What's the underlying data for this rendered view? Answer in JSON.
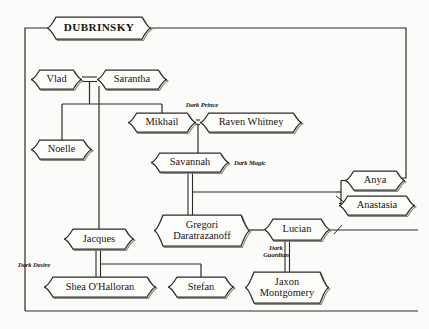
{
  "diagram": {
    "kind": "family-tree",
    "title": "DUBRINSKY",
    "frame_color": "#2c2a26",
    "background_color": "#fbfbfa",
    "line_color": "#2c2a26"
  },
  "nodes": [
    {
      "id": "dubrinsky",
      "label": "DUBRINSKY",
      "x": 47,
      "y": 17,
      "w": 104,
      "h": 22,
      "font": 11.2,
      "bold": true,
      "lines": 1
    },
    {
      "id": "vlad",
      "label": "Vlad",
      "x": 31,
      "y": 70,
      "w": 51,
      "h": 19,
      "font": 10.4,
      "bold": false,
      "lines": 1
    },
    {
      "id": "sarantha",
      "label": "Sarantha",
      "x": 97,
      "y": 70,
      "w": 70,
      "h": 19,
      "font": 10.4,
      "bold": false,
      "lines": 1
    },
    {
      "id": "noelle",
      "label": "Noelle",
      "x": 31,
      "y": 140,
      "w": 61,
      "h": 19,
      "font": 10.4,
      "bold": false,
      "lines": 1
    },
    {
      "id": "mikhail",
      "label": "Mikhail",
      "x": 128,
      "y": 113,
      "w": 68,
      "h": 19,
      "font": 10.4,
      "bold": false,
      "lines": 1
    },
    {
      "id": "raven",
      "label": "Raven Whitney",
      "x": 200,
      "y": 113,
      "w": 102,
      "h": 19,
      "font": 10.4,
      "bold": false,
      "lines": 1
    },
    {
      "id": "savannah",
      "label": "Savannah",
      "x": 151,
      "y": 153,
      "w": 78,
      "h": 19,
      "font": 10.4,
      "bold": false,
      "lines": 1
    },
    {
      "id": "anya",
      "label": "Anya",
      "x": 345,
      "y": 171,
      "w": 60,
      "h": 19,
      "font": 10.4,
      "bold": false,
      "lines": 1
    },
    {
      "id": "anastasia",
      "label": "Anastasia",
      "x": 339,
      "y": 196,
      "w": 76,
      "h": 19,
      "font": 10.4,
      "bold": false,
      "lines": 1
    },
    {
      "id": "gregori",
      "label": "Gregori\nDaratrazanoff",
      "x": 154,
      "y": 215,
      "w": 96,
      "h": 31,
      "font": 10.4,
      "bold": false,
      "lines": 2
    },
    {
      "id": "lucian",
      "label": "Lucian",
      "x": 264,
      "y": 219,
      "w": 66,
      "h": 21,
      "font": 10.4,
      "bold": false,
      "lines": 1
    },
    {
      "id": "jacques",
      "label": "Jacques",
      "x": 64,
      "y": 229,
      "w": 70,
      "h": 20,
      "font": 10.4,
      "bold": false,
      "lines": 1
    },
    {
      "id": "shea",
      "label": "Shea O'Halloran",
      "x": 44,
      "y": 277,
      "w": 112,
      "h": 20,
      "font": 10.4,
      "bold": false,
      "lines": 1
    },
    {
      "id": "stefan",
      "label": "Stefan",
      "x": 168,
      "y": 277,
      "w": 66,
      "h": 20,
      "font": 10.4,
      "bold": false,
      "lines": 1
    },
    {
      "id": "jaxon",
      "label": "Jaxon\nMontgomery",
      "x": 245,
      "y": 272,
      "w": 84,
      "h": 31,
      "font": 10.4,
      "bold": false,
      "lines": 2
    }
  ],
  "annotations": [
    {
      "id": "dark-prince",
      "text": "Dark Prince",
      "x": 163,
      "y": 102,
      "w": 78,
      "align": "center"
    },
    {
      "id": "dark-magic",
      "text": "Dark Magic",
      "x": 234,
      "y": 160,
      "w": 70,
      "align": "left"
    },
    {
      "id": "dark-guardian",
      "text": "Dark\nGuardian",
      "x": 252,
      "y": 245,
      "w": 48,
      "align": "center"
    },
    {
      "id": "dark-desire",
      "text": "Dark Desire",
      "x": 18,
      "y": 262,
      "w": 62,
      "align": "left"
    }
  ],
  "relations": [
    {
      "type": "marriage",
      "from": "vlad",
      "to": "sarantha"
    },
    {
      "type": "marriage",
      "from": "mikhail",
      "to": "raven"
    },
    {
      "type": "marriage",
      "from": "jacques",
      "to": "shea"
    },
    {
      "type": "child",
      "from": "vlad-sarantha",
      "to": "noelle"
    },
    {
      "type": "child",
      "from": "vlad-sarantha",
      "to": "mikhail"
    },
    {
      "type": "child",
      "from": "vlad-sarantha",
      "to": "jacques"
    },
    {
      "type": "child",
      "from": "mikhail-raven",
      "to": "savannah"
    },
    {
      "type": "child",
      "from": "savannah",
      "to": "gregori"
    },
    {
      "type": "sibling",
      "from": "anya",
      "to": "anastasia"
    },
    {
      "type": "partner",
      "from": "gregori",
      "to": "lucian"
    },
    {
      "type": "child",
      "from": "jacques",
      "to": "stefan"
    },
    {
      "type": "child",
      "from": "lucian",
      "to": "jaxon"
    }
  ]
}
